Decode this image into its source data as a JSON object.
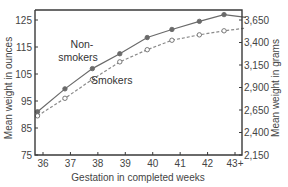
{
  "chart_data": {
    "type": "line",
    "title": "",
    "xlabel": "Gestation in completed weeks",
    "ylabel": "Mean weight in ounces",
    "y2label": "Mean weight in grams",
    "categories": [
      "36",
      "37",
      "38",
      "39",
      "40",
      "41",
      "42",
      "43+"
    ],
    "ylim": [
      75,
      128
    ],
    "yticks": [
      75,
      85,
      95,
      105,
      115,
      125
    ],
    "y2ticks": [
      "2,150",
      "2,400",
      "2,650",
      "2,900",
      "3,150",
      "3,400",
      "3,650"
    ],
    "grid": false,
    "legend_position": "inline annotations",
    "series": [
      {
        "name": "Non-smokers",
        "label_lines": [
          "Non-",
          "smokers"
        ],
        "marker": "filled-circle",
        "line_style": "solid",
        "x": [
          35.8,
          36.8,
          37.8,
          38.8,
          39.8,
          40.7,
          41.7,
          42.6,
          43.4
        ],
        "values": [
          91,
          99.5,
          107,
          112.5,
          118.5,
          121.5,
          124.5,
          127,
          126
        ]
      },
      {
        "name": "Smokers",
        "label_lines": [
          "Smokers"
        ],
        "marker": "open-circle",
        "line_style": "dashed",
        "x": [
          35.8,
          36.8,
          37.8,
          38.8,
          39.8,
          40.7,
          41.7,
          42.6,
          43.4
        ],
        "values": [
          89.5,
          96,
          103,
          109.5,
          114,
          117.5,
          119.5,
          121,
          122
        ]
      }
    ]
  }
}
